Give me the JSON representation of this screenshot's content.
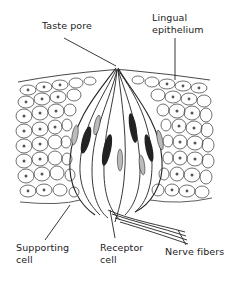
{
  "diagram": {
    "labels": {
      "taste_pore": "Taste pore",
      "lingual_epithelium_line1": "Lingual",
      "lingual_epithelium_line2": "epithelium",
      "supporting_cell_line1": "Supporting",
      "supporting_cell_line2": "cell",
      "receptor_cell_line1": "Receptor",
      "receptor_cell_line2": "cell",
      "nerve_fibers": "Nerve fibers"
    },
    "colors": {
      "ink": "#222222",
      "background": "#ffffff"
    }
  }
}
